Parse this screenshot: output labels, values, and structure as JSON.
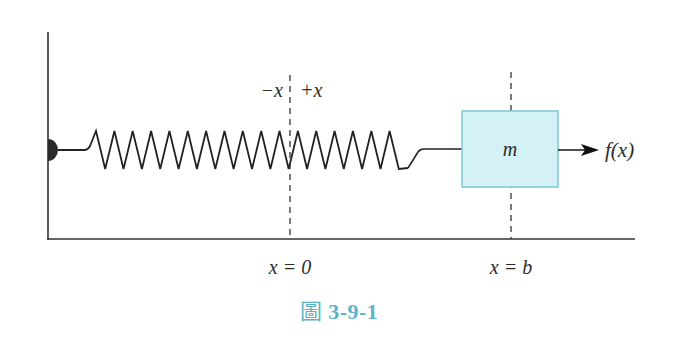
{
  "figure": {
    "caption_prefix": "圖",
    "caption_number": "3-9-1",
    "colors": {
      "line": "#333333",
      "mass_fill": "#d4f1f6",
      "mass_border": "#7ec9d6",
      "caption": "#5bb3c4"
    }
  },
  "labels": {
    "neg_direction": "−x",
    "pos_direction": "+x",
    "mass": "m",
    "force": "f(x)",
    "origin": "x = 0",
    "position_b": "x = b"
  },
  "geometry": {
    "wall_x": 48,
    "axis_y": 239,
    "axis_end_x": 635,
    "spring_y": 150,
    "spring_start_x": 96,
    "spring_end_x": 408,
    "spring_coils": 17,
    "origin_x": 290,
    "b_x": 511,
    "mass_box": {
      "x": 462,
      "y": 111,
      "w": 96,
      "h": 76
    },
    "force_arrow": {
      "x1": 558,
      "x2": 597
    }
  }
}
